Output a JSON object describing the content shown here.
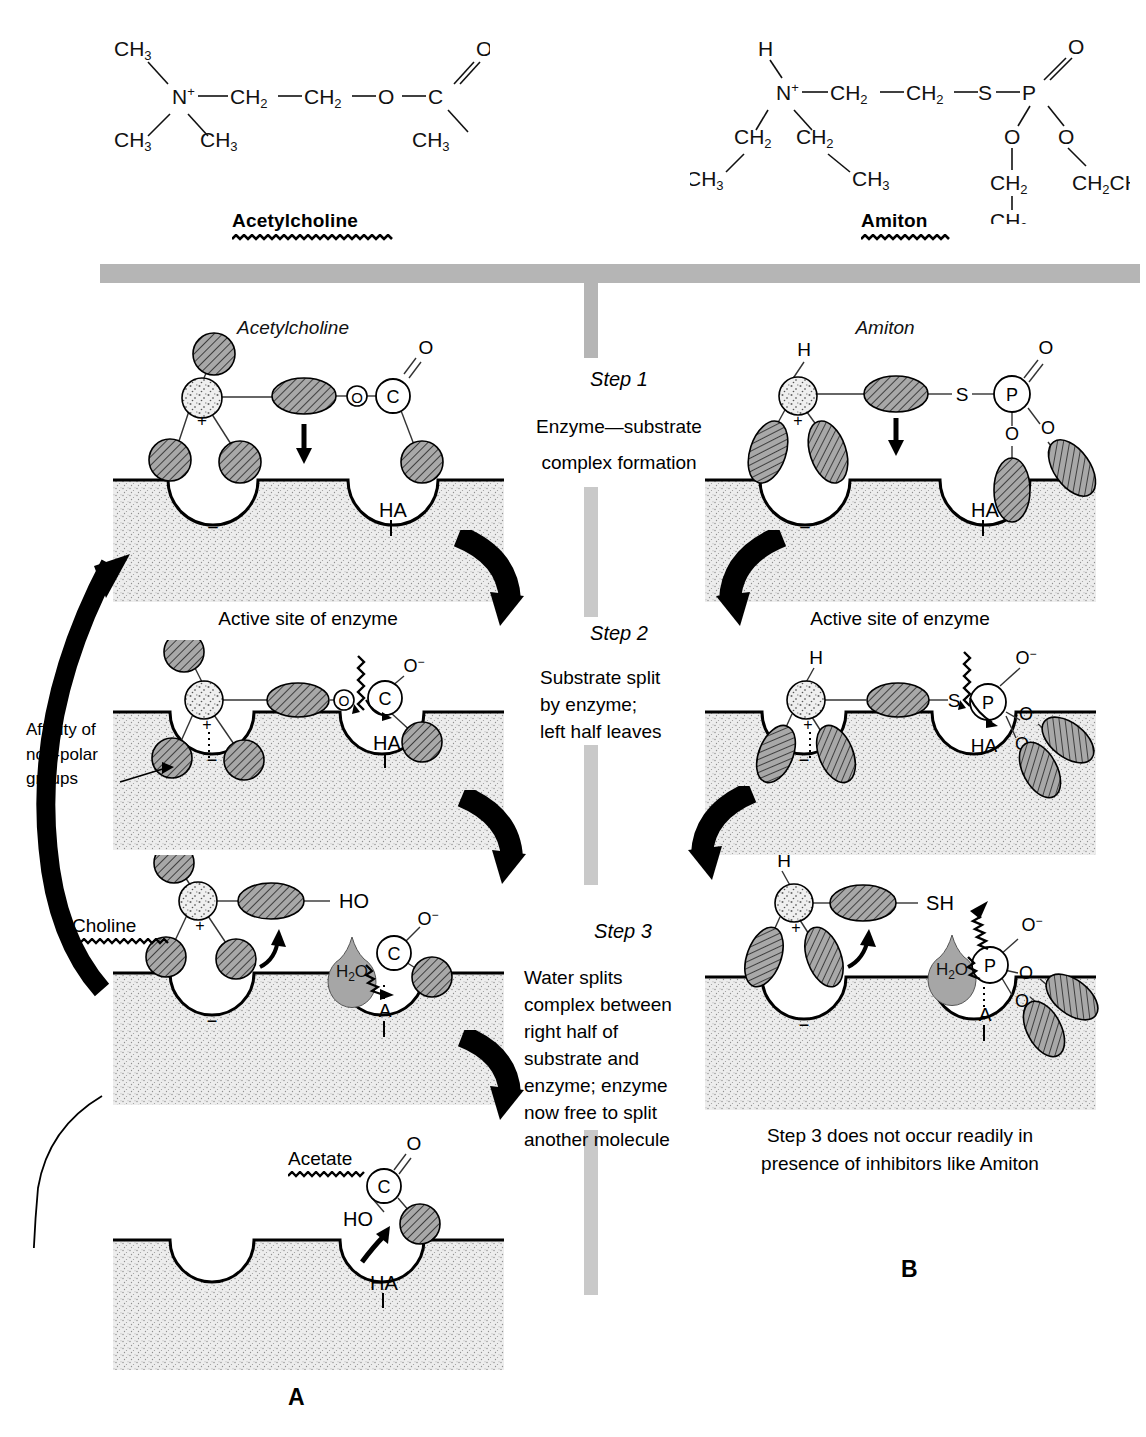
{
  "figure": {
    "panel_a_label": "A",
    "panel_b_label": "B"
  },
  "structures": {
    "left": {
      "name": "Acetylcholine",
      "atoms": {
        "ch3_top": "CH",
        "ch3_top_sub": "3",
        "n": "N",
        "n_charge": "+",
        "ch3_bl": "CH",
        "ch3_bl_sub": "3",
        "ch3_bm": "CH",
        "ch3_bm_sub": "3",
        "ch2_a": "CH",
        "ch2_a_sub": "2",
        "ch2_b": "CH",
        "ch2_b_sub": "2",
        "o_ester": "O",
        "c": "C",
        "o_carbonyl": "O",
        "ch3_right": "CH",
        "ch3_right_sub": "3"
      }
    },
    "right": {
      "name": "Amiton",
      "atoms": {
        "h": "H",
        "n": "N",
        "n_charge": "+",
        "ch2_left": "CH",
        "ch2_left_sub": "2",
        "ch3_left": "CH",
        "ch3_left_sub": "3",
        "ch2_mid": "CH",
        "ch2_mid_sub": "2",
        "ch3_mid": "CH",
        "ch3_mid_sub": "3",
        "ch2_a": "CH",
        "ch2_a_sub": "2",
        "ch2_b": "CH",
        "ch2_b_sub": "2",
        "s": "S",
        "p": "P",
        "o_double": "O",
        "o_left": "O",
        "o_right": "O",
        "ch2_lower": "CH",
        "ch2_lower_sub": "2",
        "ch3_lower": "CH",
        "ch3_lower_sub": "3",
        "ch2ch3": "CH",
        "ch2ch3_sub1": "2",
        "ch2ch3_mid": "CH",
        "ch2ch3_sub2": "3"
      }
    }
  },
  "center_column": {
    "steps": [
      {
        "title": "Step 1",
        "lines": [
          "Enzyme—substrate",
          "complex formation"
        ]
      },
      {
        "title": "Step 2",
        "lines": [
          "Substrate split",
          "by enzyme;",
          "left half leaves"
        ]
      },
      {
        "title": "Step 3",
        "lines": [
          "Water splits",
          "complex between",
          "right half of",
          "substrate and",
          "enzyme; enzyme",
          "now free to split",
          "another molecule"
        ]
      }
    ]
  },
  "panel_a": {
    "molecule_title": "Acetylcholine",
    "row1": {
      "active_site_caption": "Active site of enzyme",
      "pocket_left_label": "−",
      "pocket_right_label": "HA",
      "ester_o": "O",
      "carbon": "C",
      "carbonyl_o": "O"
    },
    "row2": {
      "affinity_label_lines": [
        "Affinity of",
        "non-polar",
        "groups"
      ],
      "pocket_left_label": "−",
      "pocket_right_label": "HA",
      "n_charge": "+",
      "ester_o": "O",
      "carbon": "C",
      "oxygen_anion": "O",
      "oxygen_anion_charge": "−"
    },
    "row3": {
      "choline_label": "Choline",
      "hydroxyl": "HO",
      "water": "H",
      "water_sub": "2",
      "water_o": "O",
      "carbon": "C",
      "oxygen_anion": "O",
      "oxygen_anion_charge": "−",
      "pocket_left_label": "−",
      "pocket_right_label": "A",
      "n_charge": "+"
    },
    "row4": {
      "acetate_label": "Acetate",
      "carbon": "C",
      "carbonyl_o": "O",
      "hydroxyl": "HO",
      "pocket_right_label": "HA"
    }
  },
  "panel_b": {
    "molecule_title": "Amiton",
    "row1": {
      "active_site_caption": "Active site of enzyme",
      "h": "H",
      "n_charge": "+",
      "s": "S",
      "p": "P",
      "o_double": "O",
      "o_left": "O",
      "o_right": "O",
      "pocket_left_label": "−",
      "pocket_right_label": "HA"
    },
    "row2": {
      "h": "H",
      "n_charge": "+",
      "s": "S",
      "p": "P",
      "o_anion": "O",
      "o_anion_charge": "−",
      "o_mid": "O",
      "o_low": "O",
      "pocket_left_label": "−",
      "pocket_right_label": "HA"
    },
    "row3": {
      "h": "H",
      "n_charge": "+",
      "sh": "SH",
      "water": "H",
      "water_sub": "2",
      "water_o": "O",
      "p": "P",
      "o_anion": "O",
      "o_anion_charge": "−",
      "o_mid": "O",
      "o_low": "O",
      "pocket_left_label": "−",
      "pocket_right_label": "A",
      "caption_lines": [
        "Step 3 does not occur readily in",
        "presence of inhibitors like Amiton"
      ]
    }
  },
  "colors": {
    "ink": "#000000",
    "divider_gray": "#b3b3b3",
    "stipple_gray": "#d9d9d9",
    "hatch_fill": "#9e9e9e",
    "water_fill": "#a6a6a6"
  }
}
